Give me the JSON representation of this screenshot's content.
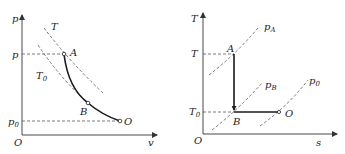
{
  "left_diagram": {
    "y_axis_label": "p",
    "x_axis_label": "v",
    "origin_label": "O",
    "y_tick_p": "p",
    "y_tick_p0": {
      "main": "p",
      "sub": "0"
    },
    "isotherm_T": "T",
    "isotherm_T0": {
      "main": "T",
      "sub": "0"
    },
    "points": {
      "A": "A",
      "B": "B",
      "O": "O"
    }
  },
  "right_diagram": {
    "y_axis_label": "T",
    "x_axis_label": "s",
    "origin_label": "O",
    "y_tick_T": "T",
    "y_tick_T0": {
      "main": "T",
      "sub": "0"
    },
    "isobar_pA": {
      "main": "p",
      "sub": "A"
    },
    "isobar_pB": {
      "main": "p",
      "sub": "B"
    },
    "isobar_p0": {
      "main": "p",
      "sub": "0"
    },
    "points": {
      "A": "A",
      "B": "B",
      "O": "O"
    }
  }
}
